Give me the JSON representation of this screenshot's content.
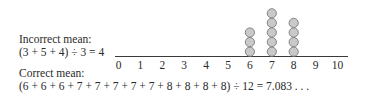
{
  "text": {
    "incorrect_label": "Incorrect mean:",
    "incorrect_equation": "(3 + 5 + 4) ÷ 3 = 4",
    "correct_label": "Correct mean:",
    "correct_equation": "(6 + 6 + 6 + 7 + 7 + 7 + 7 + 7 + 8 + 8 + 8 + 8) ÷ 12 = 7.083 . . ."
  },
  "colors": {
    "dot_fill": "#c9c9c9",
    "dot_stroke": "#7a7a7a",
    "axis": "#3a3a3a",
    "text": "#2a2a2a"
  },
  "chart_data": {
    "type": "scatter",
    "subtype": "dot_plot",
    "title": "",
    "xlabel": "",
    "ylabel": "",
    "x_ticks": [
      0,
      1,
      2,
      3,
      4,
      5,
      6,
      7,
      8,
      9,
      10
    ],
    "xlim": [
      0,
      10
    ],
    "grid": false,
    "categories": [
      6,
      7,
      8
    ],
    "values": [
      3,
      5,
      4
    ],
    "points": [
      {
        "x": 6,
        "count": 3
      },
      {
        "x": 7,
        "count": 5
      },
      {
        "x": 8,
        "count": 4
      }
    ],
    "annotations": [
      "Incorrect mean:",
      "(3 + 5 + 4) ÷ 3 = 4",
      "Correct mean:",
      "(6 + 6 + 6 + 7 + 7 + 7 + 7 + 7 + 8 + 8 + 8 + 8) ÷ 12 = 7.083 . . ."
    ]
  }
}
